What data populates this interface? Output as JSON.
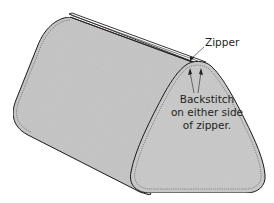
{
  "figure": {
    "type": "sewing-instruction-illustration",
    "colors": {
      "fabric_fill": "#c9c9c9",
      "fabric_fill_end": "#cdcdcd",
      "outline": "#231f20",
      "stitch_line": "#555555",
      "zipper_tape": "#ffffff",
      "background": "#ffffff"
    }
  },
  "labels": {
    "zipper": "Zipper",
    "backstitch_lines": [
      "Backstitch",
      "on either side",
      "of zipper."
    ]
  }
}
